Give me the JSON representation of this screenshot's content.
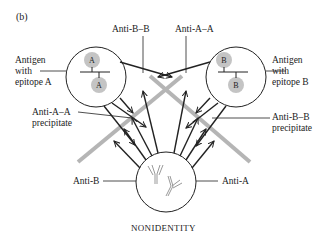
{
  "panel_label": "(b)",
  "caption": "NONIDENTITY",
  "wells": {
    "antigen_a": {
      "label_lines": [
        "Antigen",
        "with",
        "epitope A"
      ],
      "epitope": "A"
    },
    "antigen_b": {
      "label_lines": [
        "Antigen",
        "with",
        "epitope B"
      ],
      "epitope": "B"
    },
    "antibody": {
      "left_label": "Anti-B",
      "right_label": "Anti-A"
    }
  },
  "annotations": {
    "anti_b_b": "Anti-B–B",
    "anti_a_a": "Anti-A–A",
    "anti_a_a_precipitate": [
      "Anti-A–A",
      "precipitate"
    ],
    "anti_b_b_precipitate": [
      "Anti-B–B",
      "precipitate"
    ]
  },
  "colors": {
    "precipitate_line": "#b5b5b5",
    "epitope_fill": "#c4c4c4",
    "stroke": "#222222"
  }
}
